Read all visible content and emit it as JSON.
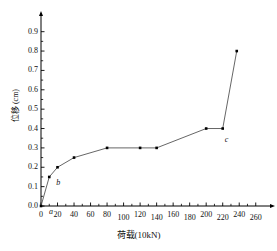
{
  "chart_data": {
    "type": "line",
    "title": "",
    "xlabel": "荷载(10kN)",
    "ylabel": "位移 (cm)",
    "xlim": [
      0,
      270
    ],
    "ylim": [
      0,
      0.95
    ],
    "grid": false,
    "legend": "none",
    "marker": "square",
    "marker_color": "#000000",
    "line_color": "#555555",
    "axis_color": "#000000",
    "x_ticks": [
      0,
      20,
      40,
      60,
      80,
      100,
      120,
      140,
      160,
      180,
      200,
      220,
      240,
      260
    ],
    "x_tick_labels": [
      "0",
      "20",
      "40",
      "60",
      "80",
      "100",
      "120",
      "140",
      "160",
      "180",
      "200",
      "220",
      "240",
      "260"
    ],
    "y_ticks": [
      0.0,
      0.1,
      0.2,
      0.3,
      0.4,
      0.5,
      0.6,
      0.7,
      0.8,
      0.9
    ],
    "y_tick_labels": [
      "0.0",
      "0.1",
      "0.2",
      "0.3",
      "0.4",
      "0.5",
      "0.6",
      "0.7",
      "0.8",
      "0.9"
    ],
    "x": [
      0,
      10,
      20,
      40,
      80,
      120,
      140,
      200,
      220,
      237
    ],
    "values": [
      0.0,
      0.15,
      0.2,
      0.25,
      0.3,
      0.3,
      0.3,
      0.4,
      0.4,
      0.8
    ],
    "annotations": [
      {
        "text": "a",
        "x": 0,
        "y": 0.0,
        "dx": 8,
        "dy": 9
      },
      {
        "text": "b",
        "x": 10,
        "y": 0.15,
        "dx": 7,
        "dy": 9
      },
      {
        "text": "c",
        "x": 220,
        "y": 0.4,
        "dx": 2,
        "dy": 14
      }
    ]
  }
}
